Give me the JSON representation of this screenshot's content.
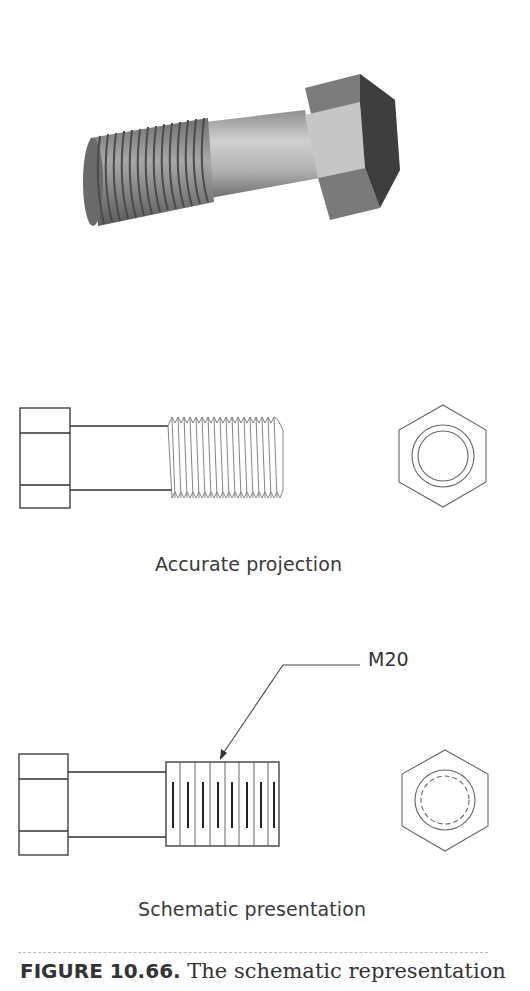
{
  "figure": {
    "render_3d": {
      "description": "Shaded 3D view of hex-head bolt with threaded shank"
    },
    "accurate": {
      "label": "Accurate projection",
      "thread_count": 22
    },
    "schematic": {
      "label": "Schematic presentation",
      "callout": "M20",
      "thread_lines": 8
    },
    "caption": {
      "number": "FIGURE 10.66.",
      "text": " The schematic representation"
    },
    "colors": {
      "line": "#333333",
      "hex_top": "#7a7a7a",
      "hex_side": "#c4c4c4",
      "hex_dark": "#3e3e3e",
      "shank": "#b8b8b8",
      "thread": "#8a8a8a"
    }
  }
}
